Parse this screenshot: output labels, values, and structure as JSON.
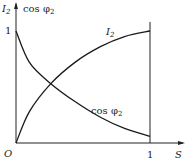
{
  "chart_data": {
    "type": "line",
    "title": "",
    "xlabel": "S",
    "ylabel_left": "I2",
    "ylabel_right": "cos φ2",
    "origin_label": "O",
    "xlim": [
      0,
      1.25
    ],
    "ylim": [
      0,
      1.2
    ],
    "x_ticks": [
      {
        "value": 1,
        "label": "1"
      }
    ],
    "y_ticks": [
      {
        "value": 1,
        "label": "1"
      }
    ],
    "grid": false,
    "vertical_reference_line_at_x": 1,
    "series": [
      {
        "name": "I2",
        "label_main": "I",
        "label_sub": "2",
        "x": [
          0,
          0.1,
          0.26,
          0.44,
          0.63,
          0.81,
          1.0
        ],
        "y": [
          0,
          0.28,
          0.53,
          0.72,
          0.86,
          0.95,
          1.0
        ]
      },
      {
        "name": "cos φ2",
        "label_main": "cos φ",
        "label_sub": "2",
        "x": [
          0,
          0.1,
          0.26,
          0.44,
          0.63,
          0.81,
          1.0
        ],
        "y": [
          1.0,
          0.72,
          0.53,
          0.37,
          0.23,
          0.13,
          0.06
        ]
      }
    ]
  }
}
